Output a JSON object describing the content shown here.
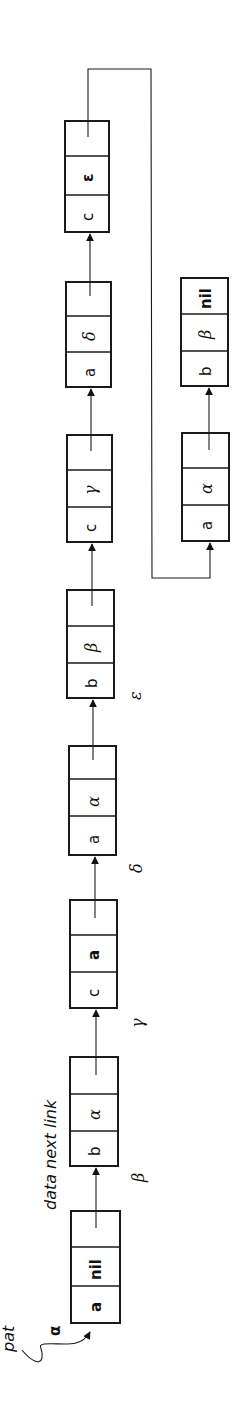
{
  "diagram": {
    "rotation": "90deg-counterclockwise",
    "pointer_label": "pat",
    "pointer_target_label": "α",
    "column_header": "data next link",
    "main_chain": [
      {
        "id": "α",
        "data": "a",
        "next": "nil",
        "link": "→β",
        "label": ""
      },
      {
        "id": "β",
        "data": "b",
        "next": "α",
        "link": "→γ",
        "label": "β"
      },
      {
        "id": "γ",
        "data": "c",
        "next": "a",
        "link": "→δ",
        "label": "γ"
      },
      {
        "id": "δ",
        "data": "a",
        "next": "α",
        "link": "→ε",
        "label": "δ"
      },
      {
        "id": "ε",
        "data": "b",
        "next": "β",
        "link": "→node6",
        "label": "ε"
      },
      {
        "id": "node6",
        "data": "c",
        "next": "γ",
        "link": "→node7",
        "label": ""
      },
      {
        "id": "node7",
        "data": "a",
        "next": "δ",
        "link": "→node8",
        "label": ""
      },
      {
        "id": "node8",
        "data": "c",
        "next": "ε",
        "link": "→side1",
        "label": ""
      }
    ],
    "side_chain": [
      {
        "id": "side1",
        "data": "a",
        "next": "α",
        "link": "→side2"
      },
      {
        "id": "side2",
        "data": "b",
        "next": "β",
        "link": "nil"
      }
    ],
    "colors": {
      "ink": "#1a1a1a",
      "paper": "#ffffff"
    }
  }
}
